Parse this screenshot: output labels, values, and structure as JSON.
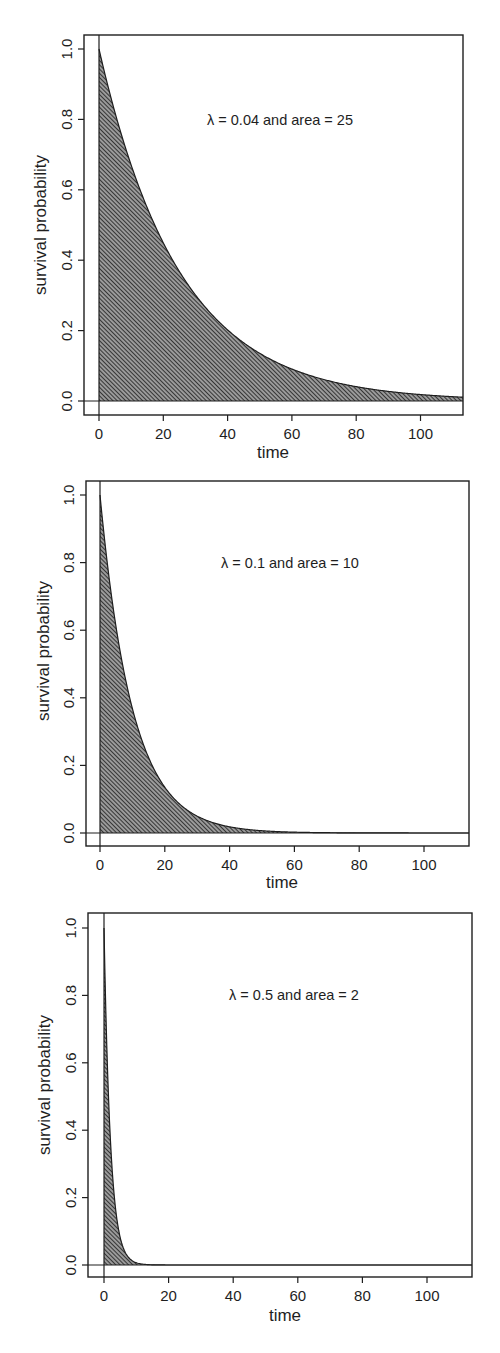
{
  "figure": {
    "panels": [
      {
        "id": "panel-lambda-0.04",
        "annotation": "λ = 0.04 and area = 25",
        "lambda": 0.04,
        "area": 25,
        "xlabel": "time",
        "ylabel": "survival probability",
        "xticks": [
          "0",
          "20",
          "40",
          "60",
          "80",
          "100"
        ],
        "yticks": [
          "0.0",
          "0.2",
          "0.4",
          "0.6",
          "0.8",
          "1.0"
        ]
      },
      {
        "id": "panel-lambda-0.1",
        "annotation": "λ = 0.1 and area = 10",
        "lambda": 0.1,
        "area": 10,
        "xlabel": "time",
        "ylabel": "survival probability",
        "xticks": [
          "0",
          "20",
          "40",
          "60",
          "80",
          "100"
        ],
        "yticks": [
          "0.0",
          "0.2",
          "0.4",
          "0.6",
          "0.8",
          "1.0"
        ]
      },
      {
        "id": "panel-lambda-0.5",
        "annotation": "λ = 0.5 and area = 2",
        "lambda": 0.5,
        "area": 2,
        "xlabel": "time",
        "ylabel": "survival probability",
        "xticks": [
          "0",
          "20",
          "40",
          "60",
          "80",
          "100"
        ],
        "yticks": [
          "0.0",
          "0.2",
          "0.4",
          "0.6",
          "0.8",
          "1.0"
        ]
      }
    ],
    "colors": {
      "axis": "#1e1e1e",
      "hatch": "#2a2a2a",
      "hatch_background": "#9a9a9a",
      "background": "#ffffff"
    }
  },
  "chart_data": [
    {
      "type": "area",
      "title": "",
      "annotation": "λ = 0.04 and area = 25",
      "xlabel": "time",
      "ylabel": "survival probability",
      "function": "S(t) = exp(-0.04 t)",
      "x": [
        0,
        10,
        20,
        30,
        40,
        50,
        60,
        70,
        80,
        90,
        100,
        110
      ],
      "y": [
        1.0,
        0.67,
        0.449,
        0.301,
        0.202,
        0.135,
        0.091,
        0.061,
        0.041,
        0.027,
        0.018,
        0.012
      ],
      "shaded_area": 25,
      "xlim": [
        -3,
        113
      ],
      "ylim": [
        -0.04,
        1.04
      ],
      "xticks": [
        0,
        20,
        40,
        60,
        80,
        100
      ],
      "yticks": [
        0.0,
        0.2,
        0.4,
        0.6,
        0.8,
        1.0
      ],
      "grid": false,
      "fill": "diagonal hatch",
      "reference_lines": [
        "x = 0",
        "y = 0"
      ]
    },
    {
      "type": "area",
      "title": "",
      "annotation": "λ = 0.1 and area = 10",
      "xlabel": "time",
      "ylabel": "survival probability",
      "function": "S(t) = exp(-0.1 t)",
      "x": [
        0,
        10,
        20,
        30,
        40,
        50,
        60,
        70,
        80,
        90,
        100,
        110
      ],
      "y": [
        1.0,
        0.368,
        0.135,
        0.05,
        0.018,
        0.007,
        0.002,
        0.001,
        0.0,
        0.0,
        0.0,
        0.0
      ],
      "shaded_area": 10,
      "xlim": [
        -3,
        113
      ],
      "ylim": [
        -0.04,
        1.04
      ],
      "xticks": [
        0,
        20,
        40,
        60,
        80,
        100
      ],
      "yticks": [
        0.0,
        0.2,
        0.4,
        0.6,
        0.8,
        1.0
      ],
      "grid": false,
      "fill": "diagonal hatch",
      "reference_lines": [
        "x = 0",
        "y = 0"
      ]
    },
    {
      "type": "area",
      "title": "",
      "annotation": "λ = 0.5 and area = 2",
      "xlabel": "time",
      "ylabel": "survival probability",
      "function": "S(t) = exp(-0.5 t)",
      "x": [
        0,
        2,
        4,
        6,
        8,
        10,
        15,
        20
      ],
      "y": [
        1.0,
        0.368,
        0.135,
        0.05,
        0.018,
        0.007,
        0.001,
        0.0
      ],
      "shaded_area": 2,
      "xlim": [
        -3,
        113
      ],
      "ylim": [
        -0.04,
        1.04
      ],
      "xticks": [
        0,
        20,
        40,
        60,
        80,
        100
      ],
      "yticks": [
        0.0,
        0.2,
        0.4,
        0.6,
        0.8,
        1.0
      ],
      "grid": false,
      "fill": "diagonal hatch",
      "reference_lines": [
        "x = 0",
        "y = 0"
      ]
    }
  ]
}
